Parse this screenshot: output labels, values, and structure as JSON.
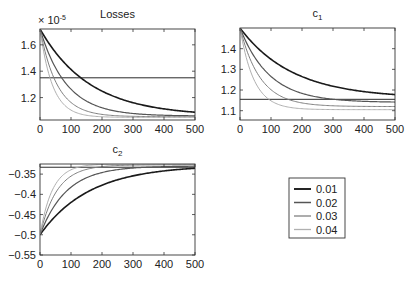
{
  "chart_data": [
    {
      "type": "line",
      "title": "Losses",
      "multiplier_label": "× 10",
      "multiplier_exp": "-5",
      "xlim": [
        0,
        500
      ],
      "ylim": [
        1.03,
        1.72
      ],
      "xticks": [
        0,
        100,
        200,
        300,
        400,
        500
      ],
      "xtick_labels": [
        "0",
        "100",
        "200",
        "300",
        "400",
        "500"
      ],
      "yticks": [
        1.2,
        1.4,
        1.6
      ],
      "ytick_labels": [
        "1.2",
        "1.4",
        "1.6"
      ],
      "reference_line": 1.35,
      "series": [
        {
          "name": "0.01",
          "start": 1.72,
          "end": 1.06,
          "tau": 160
        },
        {
          "name": "0.02",
          "start": 1.72,
          "end": 1.06,
          "tau": 85
        },
        {
          "name": "0.03",
          "start": 1.72,
          "end": 1.055,
          "tau": 55
        },
        {
          "name": "0.04",
          "start": 1.72,
          "end": 1.05,
          "tau": 40
        }
      ],
      "box": {
        "x": 40,
        "y": 29,
        "w": 155,
        "h": 91
      }
    },
    {
      "type": "line",
      "title": "c",
      "title_sub": "1",
      "xlim": [
        0,
        500
      ],
      "ylim": [
        1.055,
        1.5
      ],
      "xticks": [
        0,
        100,
        200,
        300,
        400,
        500
      ],
      "xtick_labels": [
        "0",
        "100",
        "200",
        "300",
        "400",
        "500"
      ],
      "yticks": [
        1.1,
        1.2,
        1.3,
        1.4
      ],
      "ytick_labels": [
        "1.1",
        "1.2",
        "1.3",
        "1.4"
      ],
      "reference_line": 1.155,
      "series": [
        {
          "name": "0.01",
          "start": 1.5,
          "end": 1.16,
          "tau": 170
        },
        {
          "name": "0.02",
          "start": 1.5,
          "end": 1.14,
          "tau": 95
        },
        {
          "name": "0.03",
          "start": 1.5,
          "end": 1.12,
          "tau": 65
        },
        {
          "name": "0.04",
          "start": 1.5,
          "end": 1.105,
          "tau": 45
        }
      ],
      "box": {
        "x": 240,
        "y": 28,
        "w": 155,
        "h": 92
      }
    },
    {
      "type": "line",
      "title": "c",
      "title_sub": "2",
      "xlim": [
        0,
        500
      ],
      "ylim": [
        -0.55,
        -0.325
      ],
      "xticks": [
        0,
        100,
        200,
        300,
        400,
        500
      ],
      "xtick_labels": [
        "0",
        "100",
        "200",
        "300",
        "400",
        "500"
      ],
      "yticks": [
        -0.55,
        -0.5,
        -0.45,
        -0.4,
        -0.35
      ],
      "ytick_labels": [
        "−0.55",
        "−0.5",
        "−0.45",
        "−0.4",
        "−0.35"
      ],
      "reference_line": -0.333,
      "series": [
        {
          "name": "0.01",
          "start": -0.5,
          "end": -0.328,
          "tau": 160
        },
        {
          "name": "0.02",
          "start": -0.5,
          "end": -0.33,
          "tau": 85
        },
        {
          "name": "0.03",
          "start": -0.5,
          "end": -0.327,
          "tau": 55
        },
        {
          "name": "0.04",
          "start": -0.5,
          "end": -0.325,
          "tau": 40
        }
      ],
      "box": {
        "x": 40,
        "y": 164,
        "w": 155,
        "h": 91
      }
    }
  ],
  "legend": {
    "entries": [
      {
        "label": "0.01",
        "color": "#1a1a1a",
        "width": 1.6
      },
      {
        "label": "0.02",
        "color": "#555555",
        "width": 1.2
      },
      {
        "label": "0.03",
        "color": "#808080",
        "width": 1.0
      },
      {
        "label": "0.04",
        "color": "#b0b0b0",
        "width": 1.0
      }
    ],
    "box": {
      "x": 289,
      "y": 178,
      "w": 56,
      "h": 60
    }
  },
  "colors": {
    "axes": "#333333",
    "reference_line": "#2a2a2a",
    "text": "#222222"
  }
}
